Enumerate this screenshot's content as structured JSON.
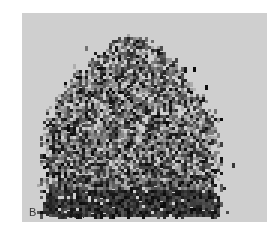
{
  "figure": {
    "panel_label": "B",
    "view_label": "POST.",
    "colors": {
      "background": "#ffffff",
      "panel": "#cfcfcf",
      "uptake_dark": "#111111"
    }
  }
}
